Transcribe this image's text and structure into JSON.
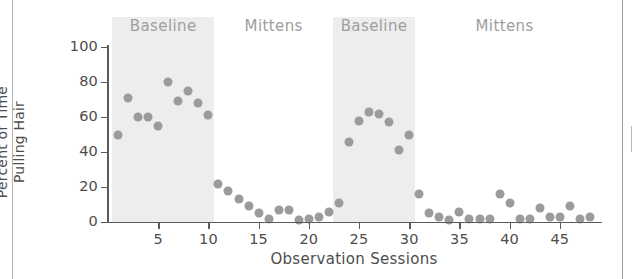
{
  "chart_data": {
    "type": "scatter",
    "title": "",
    "xlabel": "Observation Sessions",
    "ylabel_line1": "Percent of Time",
    "ylabel_line2": "Pulling Hair",
    "xlim": [
      0,
      49
    ],
    "ylim": [
      0,
      100
    ],
    "grid": false,
    "legend": "none",
    "marker_color": "#9b9b9b",
    "band_color": "#ededed",
    "axis_color": "#5a5a5a",
    "xticks": [
      5,
      10,
      15,
      20,
      25,
      30,
      35,
      40,
      45
    ],
    "xtick_labels": [
      "5",
      "10",
      "15",
      "20",
      "25",
      "30",
      "35",
      "40",
      "45"
    ],
    "yticks": [
      0,
      20,
      40,
      60,
      80,
      100
    ],
    "ytick_labels": [
      "0",
      "20",
      "40",
      "60",
      "80",
      "100"
    ],
    "phases": [
      {
        "label": "Baseline",
        "start": 1,
        "end": 10,
        "shaded": true
      },
      {
        "label": "Mittens",
        "start": 11,
        "end": 22,
        "shaded": false
      },
      {
        "label": "Baseline",
        "start": 23,
        "end": 30,
        "shaded": true
      },
      {
        "label": "Mittens",
        "start": 31,
        "end": 48,
        "shaded": false
      }
    ],
    "x": [
      1,
      2,
      3,
      4,
      5,
      6,
      7,
      8,
      9,
      10,
      11,
      12,
      13,
      14,
      15,
      16,
      17,
      18,
      19,
      20,
      21,
      22,
      23,
      24,
      25,
      26,
      27,
      28,
      29,
      30,
      31,
      32,
      33,
      34,
      35,
      36,
      37,
      38,
      39,
      40,
      41,
      42,
      43,
      44,
      45,
      46,
      47,
      48
    ],
    "values": [
      50,
      71,
      60,
      60,
      55,
      80,
      69,
      75,
      68,
      61,
      22,
      18,
      13,
      9,
      5,
      2,
      7,
      7,
      1,
      2,
      3,
      6,
      11,
      46,
      58,
      63,
      62,
      57,
      41,
      50,
      16,
      5,
      3,
      1,
      6,
      2,
      2,
      2,
      16,
      11,
      2,
      2,
      8,
      3,
      3,
      9,
      2,
      3
    ],
    "series": [
      {
        "name": "Percent of Time Pulling Hair",
        "points": [
          {
            "session": 1,
            "value": 50,
            "phase": "Baseline"
          },
          {
            "session": 2,
            "value": 71,
            "phase": "Baseline"
          },
          {
            "session": 3,
            "value": 60,
            "phase": "Baseline"
          },
          {
            "session": 4,
            "value": 60,
            "phase": "Baseline"
          },
          {
            "session": 5,
            "value": 55,
            "phase": "Baseline"
          },
          {
            "session": 6,
            "value": 80,
            "phase": "Baseline"
          },
          {
            "session": 7,
            "value": 69,
            "phase": "Baseline"
          },
          {
            "session": 8,
            "value": 75,
            "phase": "Baseline"
          },
          {
            "session": 9,
            "value": 68,
            "phase": "Baseline"
          },
          {
            "session": 10,
            "value": 61,
            "phase": "Baseline"
          },
          {
            "session": 11,
            "value": 22,
            "phase": "Mittens"
          },
          {
            "session": 12,
            "value": 18,
            "phase": "Mittens"
          },
          {
            "session": 13,
            "value": 13,
            "phase": "Mittens"
          },
          {
            "session": 14,
            "value": 9,
            "phase": "Mittens"
          },
          {
            "session": 15,
            "value": 5,
            "phase": "Mittens"
          },
          {
            "session": 16,
            "value": 2,
            "phase": "Mittens"
          },
          {
            "session": 17,
            "value": 7,
            "phase": "Mittens"
          },
          {
            "session": 18,
            "value": 7,
            "phase": "Mittens"
          },
          {
            "session": 19,
            "value": 1,
            "phase": "Mittens"
          },
          {
            "session": 20,
            "value": 2,
            "phase": "Mittens"
          },
          {
            "session": 21,
            "value": 3,
            "phase": "Mittens"
          },
          {
            "session": 22,
            "value": 6,
            "phase": "Mittens"
          },
          {
            "session": 23,
            "value": 11,
            "phase": "Mittens"
          },
          {
            "session": 24,
            "value": 46,
            "phase": "Baseline"
          },
          {
            "session": 25,
            "value": 58,
            "phase": "Baseline"
          },
          {
            "session": 26,
            "value": 63,
            "phase": "Baseline"
          },
          {
            "session": 27,
            "value": 62,
            "phase": "Baseline"
          },
          {
            "session": 28,
            "value": 57,
            "phase": "Baseline"
          },
          {
            "session": 29,
            "value": 41,
            "phase": "Baseline"
          },
          {
            "session": 30,
            "value": 50,
            "phase": "Baseline"
          },
          {
            "session": 31,
            "value": 16,
            "phase": "Mittens"
          },
          {
            "session": 32,
            "value": 5,
            "phase": "Mittens"
          },
          {
            "session": 33,
            "value": 3,
            "phase": "Mittens"
          },
          {
            "session": 34,
            "value": 1,
            "phase": "Mittens"
          },
          {
            "session": 35,
            "value": 6,
            "phase": "Mittens"
          },
          {
            "session": 36,
            "value": 2,
            "phase": "Mittens"
          },
          {
            "session": 37,
            "value": 2,
            "phase": "Mittens"
          },
          {
            "session": 38,
            "value": 2,
            "phase": "Mittens"
          },
          {
            "session": 39,
            "value": 16,
            "phase": "Mittens"
          },
          {
            "session": 40,
            "value": 11,
            "phase": "Mittens"
          },
          {
            "session": 41,
            "value": 2,
            "phase": "Mittens"
          },
          {
            "session": 42,
            "value": 2,
            "phase": "Mittens"
          },
          {
            "session": 43,
            "value": 8,
            "phase": "Mittens"
          },
          {
            "session": 44,
            "value": 3,
            "phase": "Mittens"
          },
          {
            "session": 45,
            "value": 3,
            "phase": "Mittens"
          },
          {
            "session": 46,
            "value": 9,
            "phase": "Mittens"
          },
          {
            "session": 47,
            "value": 2,
            "phase": "Mittens"
          },
          {
            "session": 48,
            "value": 3,
            "phase": "Mittens"
          }
        ]
      }
    ]
  }
}
